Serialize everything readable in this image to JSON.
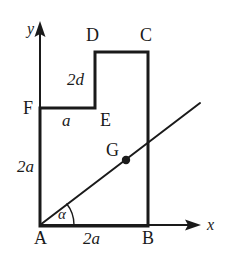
{
  "figure": {
    "stroke_color": "#1a1a1a",
    "axis_color": "#1a1a1a",
    "background_color": "#ffffff",
    "shape_stroke_width": 3,
    "axis_stroke_width": 2,
    "diagonal_stroke_width": 2
  },
  "axes": {
    "x_label": "x",
    "y_label": "y",
    "origin_label": "A"
  },
  "vertices": [
    {
      "key": "A",
      "label": "A",
      "x": 40,
      "y": 225
    },
    {
      "key": "B",
      "label": "B",
      "x": 148,
      "y": 225
    },
    {
      "key": "C",
      "label": "C",
      "x": 148,
      "y": 52
    },
    {
      "key": "D",
      "label": "D",
      "x": 95,
      "y": 52
    },
    {
      "key": "E",
      "label": "E",
      "x": 95,
      "y": 108
    },
    {
      "key": "F",
      "label": "F",
      "x": 40,
      "y": 108
    },
    {
      "key": "G",
      "label": "G",
      "x": 126,
      "y": 160
    }
  ],
  "labels": {
    "D": "D",
    "C": "C",
    "F": "F",
    "E": "E",
    "G": "G",
    "A": "A",
    "B": "B",
    "two_d": "2d",
    "a": "a",
    "two_a_left": "2a",
    "two_a_bottom": "2a",
    "alpha": "α",
    "x_axis": "x",
    "y_axis": "y"
  },
  "dimensions": {
    "AB": "2a",
    "AF": "2a",
    "FE": "a",
    "DE": "2d"
  },
  "angle": {
    "symbol": "α",
    "at_vertex": "A",
    "between": [
      "AB",
      "AG-line"
    ]
  },
  "centroid": {
    "label": "G",
    "marker": "filled-dot",
    "radius": 4
  },
  "geometry": {
    "shape_path": "M 40 225 L 148 225 L 148 52 L 95 52 L 95 108 L 40 108 Z",
    "diagonal_start": {
      "x": 40,
      "y": 225
    },
    "diagonal_end": {
      "x": 200,
      "y": 103
    },
    "x_axis_line": {
      "x1": 40,
      "y1": 225,
      "x2": 196,
      "y2": 225
    },
    "y_axis_line": {
      "x1": 40,
      "y1": 225,
      "x2": 40,
      "y2": 26
    },
    "angle_arc": "M 73 225 A 33 33 0 0 0 66 205"
  }
}
